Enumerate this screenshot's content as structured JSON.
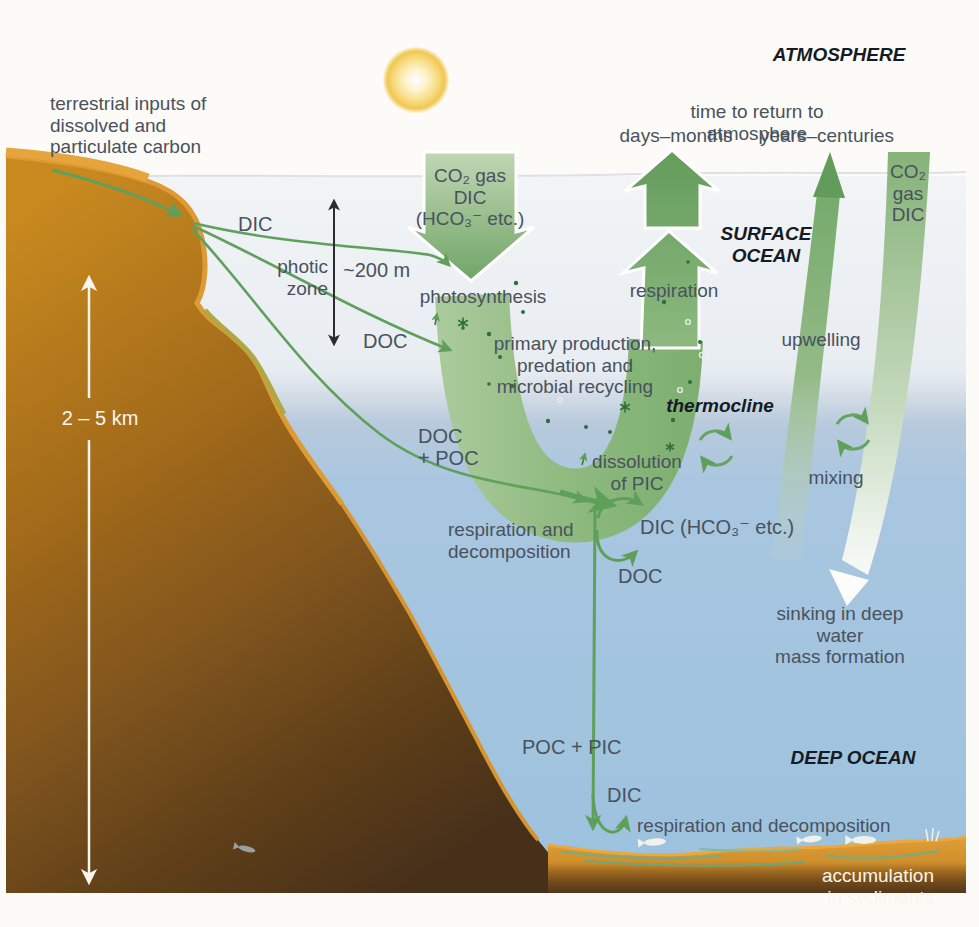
{
  "labels": {
    "atmosphere": "ATMOSPHERE",
    "terrestrial_inputs": "terrestrial inputs of\ndissolved and\nparticulate carbon",
    "time_to_return": "time to return to atmosphere",
    "days_months": "days–months",
    "years_centuries": "years–centuries",
    "co2_gas_dic_down": "CO₂ gas\nDIC\n(HCO₃⁻ etc.)",
    "surface_ocean": "SURFACE\nOCEAN",
    "co2_gas_dic_right": "CO₂ gas\nDIC",
    "dic_river": "DIC",
    "photic_zone": "photic\nzone",
    "depth_200m": "~200 m",
    "photosynthesis": "photosynthesis",
    "respiration_surface": "respiration",
    "doc_river": "DOC",
    "primary_production": "primary production,\npredation and\nmicrobial recycling",
    "thermocline": "thermocline",
    "upwelling": "upwelling",
    "mixing": "mixing",
    "doc_poc": "DOC\n+ POC",
    "dissolution_of_pic": "dissolution\nof PIC",
    "respiration_decomposition_mid": "respiration and\ndecomposition",
    "dic_hco3_mid": "DIC (HCO₃⁻ etc.)",
    "doc_mid": "DOC",
    "sinking_deep_water": "sinking in deep water\nmass formation",
    "poc_pic": "POC + PIC",
    "deep_ocean": "DEEP OCEAN",
    "dic_bottom": "DIC",
    "respiration_decomposition_bottom": "respiration and decomposition",
    "accumulation_sediments": "accumulation in sediments",
    "depth_scale": "2 – 5 km"
  },
  "colors": {
    "accent_green": "#6aa563",
    "band_green": "#8fba80",
    "surface_water": "#e9edf2",
    "deep_water": "#9ec3de",
    "land_orange_rim": "#dd9a35",
    "land_brown": "#7f541d",
    "sediment_orange": "#d6942c",
    "sun_yellow": "#f3cd5e",
    "text_dark": "#49525d",
    "text_zone": "#151b24",
    "text_white": "#f8f6ee"
  }
}
